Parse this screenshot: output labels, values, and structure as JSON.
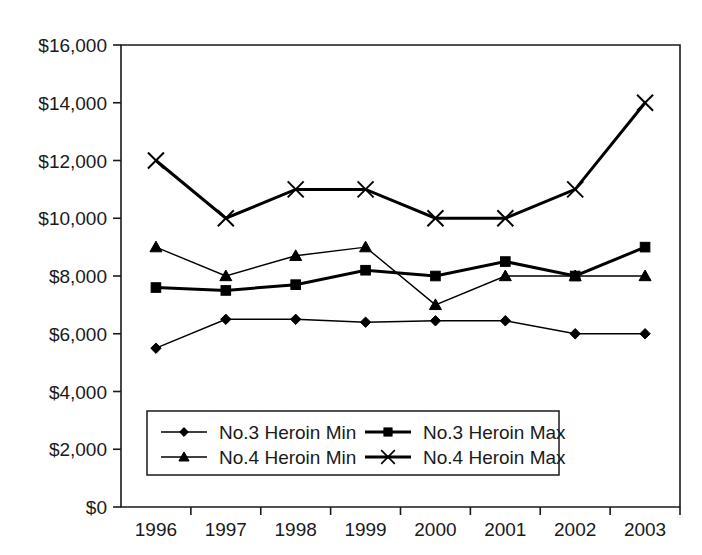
{
  "chart_data": {
    "type": "line",
    "title": "",
    "subtitle": "",
    "xlabel": "",
    "ylabel": "",
    "categories": [
      "1996",
      "1997",
      "1998",
      "1999",
      "2000",
      "2001",
      "2002",
      "2003"
    ],
    "x": [
      1996,
      1997,
      1998,
      1999,
      2000,
      2001,
      2002,
      2003
    ],
    "ylim": [
      0,
      16000
    ],
    "yticks": [
      0,
      2000,
      4000,
      6000,
      8000,
      10000,
      12000,
      14000,
      16000
    ],
    "ytick_labels": [
      "$0",
      "$2,000",
      "$4,000",
      "$6,000",
      "$8,000",
      "$10,000",
      "$12,000",
      "$14,000",
      "$16,000"
    ],
    "grid": false,
    "legend_position": "inside-bottom-center",
    "currency": "USD",
    "series": [
      {
        "name": "No.3 Heroin Min",
        "marker": "diamond",
        "line_width": 1.4,
        "values": [
          5500,
          6500,
          6500,
          6400,
          6450,
          6450,
          6000,
          6000
        ]
      },
      {
        "name": "No.3 Heroin Max",
        "marker": "square",
        "line_width": 3.0,
        "values": [
          7600,
          7500,
          7700,
          8200,
          8000,
          8500,
          8000,
          9000
        ]
      },
      {
        "name": "No.4 Heroin Min",
        "marker": "triangle",
        "line_width": 1.4,
        "values": [
          9000,
          8000,
          8700,
          9000,
          7000,
          8000,
          8000,
          8000
        ]
      },
      {
        "name": "No.4 Heroin Max",
        "marker": "x",
        "line_width": 3.0,
        "values": [
          12000,
          10000,
          11000,
          11000,
          10000,
          10000,
          11000,
          14000
        ]
      }
    ],
    "colors": {
      "series_stroke": "#000000",
      "axis": "#1a1a1a",
      "background": "#ffffff"
    }
  },
  "legend": {
    "entries": [
      {
        "label": "No.3 Heroin Min",
        "marker": "diamond"
      },
      {
        "label": "No.3 Heroin Max",
        "marker": "square"
      },
      {
        "label": "No.4 Heroin Min",
        "marker": "triangle"
      },
      {
        "label": "No.4 Heroin Max",
        "marker": "x"
      }
    ]
  }
}
